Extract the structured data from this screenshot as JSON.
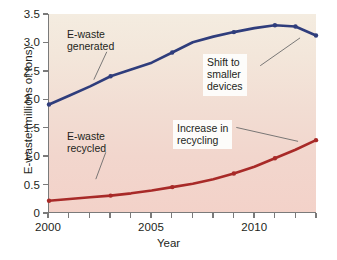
{
  "chart_data": {
    "type": "line",
    "title": "",
    "xlabel": "Year",
    "ylabel": "E-waste (millions of tons)",
    "xlim": [
      2000,
      2013
    ],
    "ylim": [
      0,
      3.5
    ],
    "grid": false,
    "legend_position": "inline-annotations",
    "x": [
      2000,
      2001,
      2002,
      2003,
      2004,
      2005,
      2006,
      2007,
      2008,
      2009,
      2010,
      2011,
      2012,
      2013
    ],
    "xticks": [
      2000,
      2001,
      2002,
      2003,
      2004,
      2005,
      2006,
      2007,
      2008,
      2009,
      2010,
      2011,
      2012,
      2013
    ],
    "xtick_labels": [
      "2000",
      "",
      "",
      "",
      "",
      "2005",
      "",
      "",
      "",
      "",
      "2010",
      "",
      "",
      ""
    ],
    "yticks": [
      0,
      0.5,
      1.0,
      1.5,
      2.0,
      2.5,
      3.0,
      3.5
    ],
    "ytick_labels": [
      "0",
      "0.5",
      "1.0",
      "1.5",
      "2.0",
      "2.5",
      "3.0",
      "3.5"
    ],
    "series": [
      {
        "name": "E-waste generated",
        "color": "#2f3d7c",
        "markers": [
          2000,
          2003,
          2006,
          2009,
          2011,
          2012,
          2013
        ],
        "values": [
          1.9,
          2.06,
          2.22,
          2.4,
          2.52,
          2.64,
          2.82,
          3.0,
          3.1,
          3.18,
          3.25,
          3.3,
          3.28,
          3.12
        ]
      },
      {
        "name": "E-waste recycled",
        "color": "#a82a28",
        "markers": [
          2000,
          2003,
          2006,
          2009,
          2011,
          2013
        ],
        "values": [
          0.2,
          0.23,
          0.26,
          0.29,
          0.33,
          0.38,
          0.44,
          0.5,
          0.58,
          0.68,
          0.8,
          0.95,
          1.1,
          1.27
        ]
      }
    ],
    "annotations": [
      {
        "id": "ewaste-generated",
        "text": "E-waste\ngenerated",
        "boxed": false
      },
      {
        "id": "ewaste-recycled",
        "text": "E-waste\nrecycled",
        "boxed": false
      },
      {
        "id": "shift-to-smaller-devices",
        "text": "Shift to\nsmaller\ndevices",
        "boxed": true
      },
      {
        "id": "increase-in-recycling",
        "text": "Increase in\nrecycling",
        "boxed": true
      }
    ]
  }
}
